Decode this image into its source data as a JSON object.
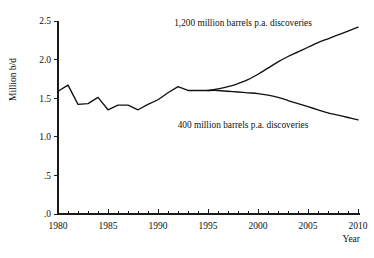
{
  "chart_data": {
    "type": "line",
    "title": "",
    "xlabel": "Year",
    "ylabel": "Million b/d",
    "xlim": [
      1980,
      2010
    ],
    "ylim": [
      0,
      2.5
    ],
    "grid": false,
    "legend_position": "inline-annotations",
    "x_ticks_major": [
      "1980",
      "1985",
      "1990",
      "1995",
      "2000",
      "2005",
      "2010"
    ],
    "x_ticks_major_values": [
      1980,
      1985,
      1990,
      1995,
      2000,
      2005,
      2010
    ],
    "x_minor_tick_step": 1,
    "y_ticks": [
      ".0",
      ".5",
      "1.0",
      "1.5",
      "2.0",
      "2.5"
    ],
    "y_tick_values": [
      0,
      0.5,
      1.0,
      1.5,
      2.0,
      2.5
    ],
    "annotations": [
      {
        "text": "1,200 million barrels p.a. discoveries",
        "x": 1998.5,
        "y": 2.44
      },
      {
        "text": "400 million barrels p.a. discoveries",
        "x": 1998.5,
        "y": 1.12
      }
    ],
    "series": [
      {
        "name": "historical",
        "label": "Historical production",
        "x": [
          1980,
          1981,
          1982,
          1983,
          1984,
          1985,
          1986,
          1987,
          1988,
          1989,
          1990,
          1991,
          1992,
          1993,
          1994,
          1995
        ],
        "values": [
          1.59,
          1.67,
          1.42,
          1.43,
          1.51,
          1.35,
          1.41,
          1.41,
          1.35,
          1.42,
          1.48,
          1.57,
          1.65,
          1.6,
          1.6,
          1.6
        ]
      },
      {
        "name": "high-discoveries",
        "label": "1,200 million barrels p.a. discoveries",
        "x": [
          1995,
          1996,
          1997,
          1998,
          1999,
          2000,
          2001,
          2002,
          2003,
          2004,
          2005,
          2006,
          2007,
          2008,
          2009,
          2010
        ],
        "values": [
          1.6,
          1.62,
          1.65,
          1.69,
          1.74,
          1.81,
          1.89,
          1.97,
          2.04,
          2.1,
          2.16,
          2.22,
          2.27,
          2.32,
          2.37,
          2.42
        ]
      },
      {
        "name": "low-discoveries",
        "label": "400 million barrels p.a. discoveries",
        "x": [
          1995,
          1996,
          1997,
          1998,
          1999,
          2000,
          2001,
          2002,
          2003,
          2004,
          2005,
          2006,
          2007,
          2008,
          2009,
          2010
        ],
        "values": [
          1.6,
          1.6,
          1.59,
          1.58,
          1.57,
          1.56,
          1.54,
          1.51,
          1.47,
          1.43,
          1.39,
          1.35,
          1.31,
          1.28,
          1.25,
          1.22
        ]
      }
    ]
  }
}
